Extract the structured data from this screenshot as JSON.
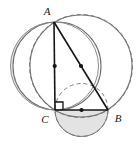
{
  "figure": {
    "type": "geometric-diagram",
    "background_color": "#ffffff",
    "stroke_color": "#555555",
    "line_color": "#1a1a1a",
    "shade_color": "#e3e3e3",
    "shade_stroke": "#777777",
    "dash_color": "#7a7a7a"
  },
  "labels": {
    "a": "A",
    "b": "B",
    "c": "C"
  },
  "points": {
    "A": {
      "x": 54,
      "y": 22
    },
    "B": {
      "x": 108,
      "y": 110
    },
    "C": {
      "x": 55,
      "y": 110
    },
    "mid_AC": {
      "x": 54.5,
      "y": 66
    },
    "mid_AB": {
      "x": 81,
      "y": 66
    },
    "mid_CB": {
      "x": 81.5,
      "y": 110
    }
  },
  "circles": {
    "big_left": {
      "cx": 57,
      "cy": 66,
      "r": 44,
      "style": "solid"
    },
    "big_right": {
      "cx": 81,
      "cy": 66,
      "r": 51,
      "style": "solid"
    },
    "diameter_AC": {
      "cx": 54.5,
      "cy": 66,
      "r": 44,
      "style": "solid"
    },
    "diameter_AB": {
      "cx": 81,
      "cy": 66,
      "r": 51.5,
      "style": "dashed"
    },
    "diameter_CB": {
      "cx": 81.5,
      "cy": 110,
      "r": 26.5,
      "style": "dashed"
    }
  },
  "marks": {
    "right_angle_at": "C",
    "midpoint_dots": 3
  },
  "shaded_regions": [
    {
      "name": "left-lune",
      "description": "crescent between semicircle on AC and large left circle"
    },
    {
      "name": "bottom-lune",
      "description": "semicircle on CB below the line CB"
    }
  ]
}
